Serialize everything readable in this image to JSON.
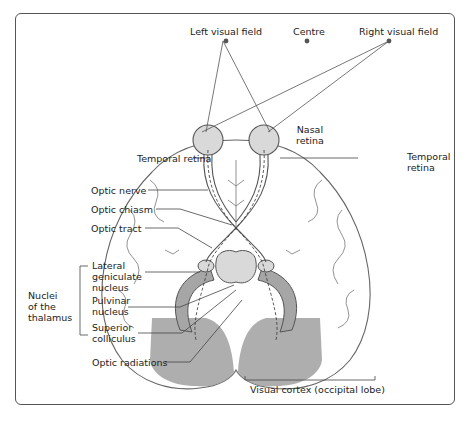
{
  "diagram": {
    "title_labels": {
      "left_visual_field": "Left visual field",
      "centre": "Centre",
      "right_visual_field": "Right visual field"
    },
    "labels": {
      "nasal_retina": "Nasal\nretina",
      "temporal_retina_left": "Temporal retina",
      "temporal_retina_right": "Temporal\nretina",
      "optic_nerve": "Optic nerve",
      "optic_chiasm": "Optic chiasm",
      "optic_tract": "Optic tract",
      "lateral_geniculate_nucleus": "Lateral\ngeniculate\nnucleus",
      "pulvinar_nucleus": "Pulvinar\nnucleus",
      "superior_colliculus": "Superior\ncolliculus",
      "optic_radiations": "Optic radiations",
      "nuclei_of_thalamus": "Nuclei\nof the\nthalamus",
      "visual_cortex": "Visual cortex (occipital lobe)"
    },
    "colors": {
      "outline": "#555555",
      "structure_fill": "#d9d9d9",
      "cortex_fill": "#a6a6a6",
      "text": "#222222"
    }
  }
}
